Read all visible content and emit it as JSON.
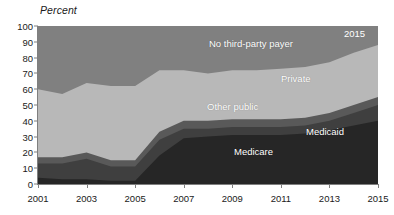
{
  "chart_data": {
    "type": "area",
    "title": "",
    "subtitle": "",
    "ylabel": "Percent",
    "xlabel": "",
    "ylim": [
      0,
      100
    ],
    "ytick_step": 10,
    "yticks": [
      "100",
      "90",
      "80",
      "70",
      "60",
      "50",
      "40",
      "30",
      "20",
      "10",
      "0"
    ],
    "grid": false,
    "legend_position": "inline-annotations",
    "stacked": true,
    "x": [
      2001,
      2002,
      2003,
      2004,
      2005,
      2006,
      2007,
      2008,
      2009,
      2010,
      2011,
      2012,
      2013,
      2014,
      2015
    ],
    "xticks": [
      "2001",
      "2003",
      "2005",
      "2007",
      "2009",
      "2011",
      "2013",
      "2015"
    ],
    "series": [
      {
        "name": "Medicare",
        "color": "#262626",
        "values": [
          4,
          3,
          3,
          2,
          2,
          18,
          29,
          30,
          31,
          31,
          31,
          32,
          34,
          37,
          40
        ]
      },
      {
        "name": "Medicaid",
        "color": "#3f3f3f",
        "values": [
          9,
          10,
          13,
          9,
          9,
          10,
          6,
          5,
          5,
          5,
          5,
          5,
          6,
          8,
          10
        ]
      },
      {
        "name": "Other public",
        "color": "#595959",
        "values": [
          4,
          4,
          4,
          4,
          4,
          5,
          5,
          5,
          5,
          5,
          5,
          5,
          5,
          5,
          5
        ]
      },
      {
        "name": "Private",
        "color": "#b8b8b8",
        "values": [
          43,
          40,
          44,
          47,
          47,
          39,
          32,
          30,
          31,
          31,
          32,
          32,
          32,
          33,
          33
        ]
      },
      {
        "name": "No third-party payer",
        "color": "#808080",
        "values": [
          40,
          43,
          36,
          38,
          38,
          28,
          28,
          30,
          28,
          28,
          27,
          26,
          23,
          17,
          12
        ]
      }
    ],
    "cumulative_tops": {
      "medicare": [
        4,
        3,
        3,
        2,
        2,
        18,
        29,
        30,
        31,
        31,
        31,
        32,
        34,
        37,
        40
      ],
      "medicaid": [
        13,
        13,
        16,
        11,
        11,
        28,
        35,
        35,
        36,
        36,
        36,
        37,
        40,
        45,
        50
      ],
      "other_public": [
        17,
        17,
        20,
        15,
        15,
        33,
        40,
        40,
        41,
        41,
        41,
        42,
        45,
        50,
        55
      ],
      "private": [
        60,
        57,
        64,
        62,
        62,
        72,
        72,
        70,
        72,
        72,
        73,
        74,
        77,
        83,
        88
      ],
      "no_third_party_payer": [
        100,
        100,
        100,
        100,
        100,
        100,
        100,
        100,
        100,
        100,
        100,
        100,
        100,
        100,
        100
      ]
    },
    "annotations": [
      {
        "name": "no-third-party-payer",
        "text": "No third-party payer"
      },
      {
        "name": "private",
        "text": "Private"
      },
      {
        "name": "other-public",
        "text": "Other public"
      },
      {
        "name": "medicaid",
        "text": "Medicaid"
      },
      {
        "name": "medicare",
        "text": "Medicare"
      },
      {
        "name": "end-year",
        "text": "2015"
      }
    ]
  },
  "axis": {
    "y_title": "Percent"
  },
  "colors": {
    "medicare": "#262626",
    "medicaid": "#3f3f3f",
    "other_public": "#595959",
    "private": "#b8b8b8",
    "no_third_party_payer": "#808080",
    "axis": "#7f7f7f",
    "text": "#1a1a1a",
    "label_text": "#ffffff",
    "background": "#ffffff"
  }
}
